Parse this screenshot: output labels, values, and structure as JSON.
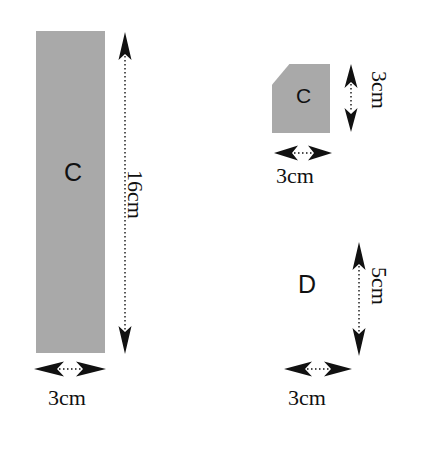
{
  "canvas": {
    "width": 423,
    "height": 449,
    "background": "#ffffff",
    "shape_fill": "#a9a9a9",
    "ink": "#111111"
  },
  "figure": {
    "title": ""
  },
  "shapes": [
    {
      "id": "rect-c",
      "label": "C",
      "kind": "rectangle",
      "fill": "#a9a9a9",
      "width_label": "3cm",
      "height_label": "16cm"
    },
    {
      "id": "pentagon-c",
      "label": "C",
      "kind": "pentagon-bevelled-corner",
      "fill": "#a9a9a9",
      "width_label": "3cm",
      "height_label": "3cm"
    },
    {
      "id": "region-d",
      "label": "D",
      "kind": "unshaded-region",
      "fill": "none",
      "width_label": "3cm",
      "height_label": "5cm"
    }
  ],
  "dimensions": {
    "rect_c_height": "16cm",
    "rect_c_width": "3cm",
    "pentagon_c_height": "3cm",
    "pentagon_c_width": "3cm",
    "region_d_height": "5cm",
    "region_d_width": "3cm"
  }
}
